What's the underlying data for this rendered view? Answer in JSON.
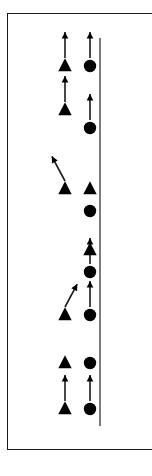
{
  "figure": {
    "background_color": "#ffffff",
    "ink_color": "#000000",
    "frame": {
      "label": "panel-border",
      "visible": true,
      "color": "#1b1b1b",
      "cropped_right_edge": true
    },
    "reference_line": {
      "label": "vertical-reference-line",
      "orientation": "vertical",
      "x": 100,
      "y_top": 38,
      "y_bottom": 426,
      "color": "#333333"
    },
    "columns": [
      {
        "id": "left",
        "marker": "triangle",
        "x": 65
      },
      {
        "id": "right",
        "marker": "circle",
        "x": 90
      }
    ]
  },
  "chart_data": {
    "type": "scatter",
    "title": "",
    "subtitle": "",
    "xlabel": "",
    "ylabel": "",
    "grid": false,
    "legend": null,
    "axis": {
      "vertical_reference_x": 100,
      "y_range_px": [
        38,
        426
      ]
    },
    "marker_legend": [
      {
        "symbol": "triangle",
        "column": "left",
        "fill": "#000000"
      },
      {
        "symbol": "circle",
        "column": "right",
        "fill": "#000000"
      }
    ],
    "series": [
      {
        "name": "triangle-column",
        "symbol": "triangle",
        "x": 65,
        "points": [
          {
            "y": 66,
            "vector": {
              "present": true,
              "angle_deg": 90,
              "length": 26
            }
          },
          {
            "y": 110,
            "vector": {
              "present": true,
              "angle_deg": 90,
              "length": 26
            }
          },
          {
            "y": 189,
            "vector": {
              "present": true,
              "angle_deg": 118,
              "length": 28
            }
          },
          {
            "y": 315,
            "vector": {
              "present": true,
              "angle_deg": 62,
              "length": 26
            }
          },
          {
            "y": 363,
            "vector": {
              "present": false,
              "angle_deg": 0,
              "length": 0
            }
          },
          {
            "y": 409,
            "vector": {
              "present": true,
              "angle_deg": 90,
              "length": 26
            }
          }
        ]
      },
      {
        "name": "circle-column",
        "symbol": "circle",
        "x": 90,
        "points": [
          {
            "y": 66,
            "vector": {
              "present": true,
              "angle_deg": 90,
              "length": 26
            }
          },
          {
            "y": 128,
            "vector": {
              "present": true,
              "angle_deg": 90,
              "length": 26
            }
          },
          {
            "y": 211,
            "vector": {
              "present": false,
              "angle_deg": 0,
              "length": 0
            }
          },
          {
            "y": 272,
            "vector": {
              "present": true,
              "angle_deg": 90,
              "length": 26
            }
          },
          {
            "y": 315,
            "vector": {
              "present": true,
              "angle_deg": 90,
              "length": 26
            }
          },
          {
            "y": 363,
            "vector": {
              "present": false,
              "angle_deg": 0,
              "length": 0
            }
          },
          {
            "y": 409,
            "vector": {
              "present": true,
              "angle_deg": 90,
              "length": 26
            }
          }
        ]
      }
    ],
    "extra_markers": [
      {
        "symbol": "triangle",
        "x": 90,
        "y": 189,
        "note": "triangle on right column"
      },
      {
        "symbol": "triangle",
        "x": 90,
        "y": 250,
        "note": "triangle on right column"
      }
    ]
  }
}
